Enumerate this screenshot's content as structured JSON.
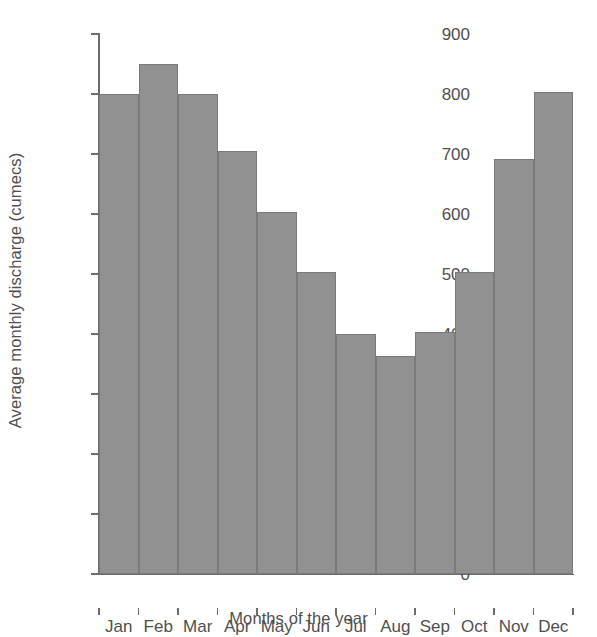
{
  "chart_data": {
    "type": "bar",
    "title": "",
    "categories": [
      "Jan",
      "Feb",
      "Mar",
      "Apr",
      "May",
      "Jun",
      "Jul",
      "Aug",
      "Sep",
      "Oct",
      "Nov",
      "Dec"
    ],
    "values": [
      800,
      850,
      800,
      705,
      603,
      503,
      400,
      363,
      403,
      503,
      692,
      803
    ],
    "xlabel": "Months of the year",
    "ylabel": "Average monthly discharge (cumecs)",
    "ylim": [
      0,
      900
    ],
    "ytick_labels": [
      "900",
      "800",
      "700",
      "600",
      "500",
      "400",
      "300",
      "200",
      "100",
      "0"
    ],
    "ytick_values": [
      900,
      800,
      700,
      600,
      500,
      400,
      300,
      200,
      100,
      0
    ],
    "ytick_step": 100,
    "grid": false,
    "legend": null,
    "bar_color": "#919191",
    "bar_edge_color": "#7a7a7a",
    "axis_color": "#6b6b6b",
    "background_color": "#ffffff",
    "text_color": "#4f4f4f"
  }
}
